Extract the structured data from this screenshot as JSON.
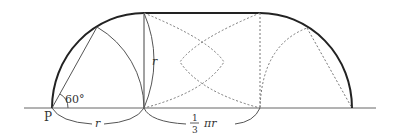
{
  "diagram": {
    "labels": {
      "point": "P",
      "angle": "60°",
      "radius_horizontal": "r",
      "radius_vertical": "r",
      "frac_num": "1",
      "frac_den": "3",
      "arc_length": "πr"
    },
    "colors": {
      "locus": "#222222",
      "construction": "#555555",
      "dotted": "#777777",
      "baseline": "#666666"
    }
  }
}
